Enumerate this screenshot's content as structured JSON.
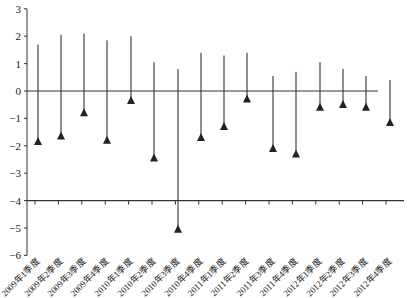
{
  "chart_data": {
    "type": "stem",
    "title": "",
    "xlabel": "",
    "ylabel": "",
    "ylim": [
      -6,
      3
    ],
    "yticks": [
      "3",
      "2",
      "1",
      "0",
      "-1",
      "-2",
      "-3",
      "-4",
      "-5",
      "-6"
    ],
    "grid": false,
    "legend": null,
    "x_axis_at": -4,
    "zero_line": 0,
    "categories": [
      "2009年1季度",
      "2009年2季度",
      "2009年3季度",
      "2009年4季度",
      "2010年1季度",
      "2010年2季度",
      "2010年3季度",
      "2010年4季度",
      "2011年1季度",
      "2011年2季度",
      "2011年3季度",
      "2011年4季度",
      "2012年1季度",
      "2012年2季度",
      "2012年3季度",
      "2012年4季度"
    ],
    "series": [
      {
        "name": "upper",
        "marker": "none",
        "values": [
          1.7,
          2.05,
          2.1,
          1.85,
          2.0,
          1.05,
          0.8,
          1.4,
          1.3,
          1.4,
          0.55,
          0.7,
          1.05,
          0.8,
          0.55,
          0.4
        ]
      },
      {
        "name": "lower",
        "marker": "triangle",
        "values": [
          -1.9,
          -1.7,
          -0.85,
          -1.85,
          -0.4,
          -2.5,
          -5.1,
          -1.75,
          -1.35,
          -0.35,
          -2.15,
          -2.35,
          -0.65,
          -0.55,
          -0.65,
          -1.2
        ]
      }
    ],
    "colors": {
      "line": "#333333",
      "marker": "#222222",
      "axis": "#333333"
    }
  }
}
